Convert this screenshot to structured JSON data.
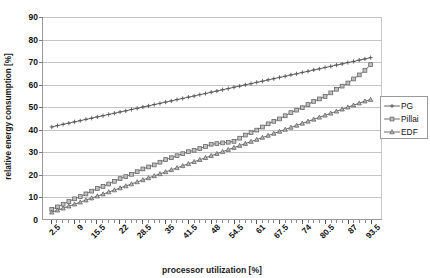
{
  "chart_data": {
    "type": "line",
    "title": "",
    "xlabel": "processor utilization [%]",
    "ylabel": "relative energy consumption [%]",
    "xlim": [
      0,
      96.75
    ],
    "ylim": [
      0,
      90
    ],
    "ytick_labels": [
      "0",
      "10",
      "20",
      "30",
      "40",
      "50",
      "60",
      "70",
      "80",
      "90"
    ],
    "ytick_values": [
      0,
      10,
      20,
      30,
      40,
      50,
      60,
      70,
      80,
      90
    ],
    "xtick_labels": [
      "2.5",
      "9",
      "15.5",
      "22",
      "28.5",
      "35",
      "41.5",
      "48",
      "54.5",
      "61",
      "67.5",
      "74",
      "80.5",
      "87",
      "93.5"
    ],
    "xtick_values": [
      2.5,
      9,
      15.5,
      22,
      28.5,
      35,
      41.5,
      48,
      54.5,
      61,
      67.5,
      74,
      80.5,
      87,
      93.5
    ],
    "grid": true,
    "legend_position": "right",
    "x": [
      2.5,
      4.125,
      5.75,
      7.375,
      9,
      10.625,
      12.25,
      13.875,
      15.5,
      17.125,
      18.75,
      20.375,
      22,
      23.625,
      25.25,
      26.875,
      28.5,
      30.125,
      31.75,
      33.375,
      35,
      36.625,
      38.25,
      39.875,
      41.5,
      43.125,
      44.75,
      46.375,
      48,
      49.625,
      51.25,
      52.875,
      54.5,
      56.125,
      57.75,
      59.375,
      61,
      62.625,
      64.25,
      65.875,
      67.5,
      69.125,
      70.75,
      72.375,
      74,
      75.625,
      77.25,
      78.875,
      80.5,
      82.125,
      83.75,
      85.375,
      87,
      88.625,
      90.25,
      91.875,
      93.5
    ],
    "series": [
      {
        "name": "PG",
        "marker": "plus",
        "color": "#555555",
        "values": [
          41.0,
          41.6,
          42.2,
          42.7,
          43.3,
          43.8,
          44.4,
          44.9,
          45.5,
          46.0,
          46.6,
          47.1,
          47.7,
          48.2,
          48.8,
          49.3,
          49.9,
          50.4,
          51.0,
          51.5,
          52.1,
          52.6,
          53.2,
          53.7,
          54.3,
          54.8,
          55.4,
          55.9,
          56.5,
          57.0,
          57.6,
          58.1,
          58.7,
          59.2,
          59.8,
          60.3,
          60.9,
          61.4,
          62.0,
          62.5,
          63.1,
          63.6,
          64.2,
          64.7,
          65.3,
          65.8,
          66.4,
          66.9,
          67.5,
          68.0,
          68.6,
          69.1,
          69.7,
          70.2,
          70.8,
          71.3,
          71.9
        ]
      },
      {
        "name": "Pillai",
        "marker": "square",
        "color": "#666666",
        "values": [
          4.3,
          5.4,
          6.6,
          7.8,
          9.0,
          10.0,
          11.2,
          12.4,
          13.6,
          14.5,
          15.6,
          16.8,
          18.0,
          18.9,
          19.9,
          21.1,
          22.3,
          23.2,
          24.1,
          25.3,
          26.5,
          27.3,
          28.2,
          29.1,
          30.0,
          30.6,
          31.4,
          32.3,
          33.3,
          33.6,
          33.9,
          34.2,
          34.6,
          36.0,
          37.4,
          38.5,
          39.6,
          41.0,
          42.4,
          43.5,
          44.6,
          46.0,
          47.4,
          48.5,
          49.6,
          51.0,
          52.4,
          53.5,
          54.6,
          56.2,
          57.8,
          59.2,
          60.6,
          62.4,
          64.2,
          66.2,
          68.8
        ]
      },
      {
        "name": "EDF",
        "marker": "triangle",
        "color": "#5a5a5a",
        "values": [
          3.0,
          3.9,
          4.8,
          5.7,
          6.6,
          7.5,
          8.4,
          9.3,
          10.2,
          11.1,
          12.0,
          12.9,
          13.8,
          14.7,
          15.6,
          16.5,
          17.4,
          18.3,
          19.2,
          20.1,
          21.0,
          21.9,
          22.8,
          23.7,
          24.6,
          25.5,
          26.4,
          27.3,
          28.2,
          29.1,
          30.0,
          30.9,
          31.8,
          32.7,
          33.6,
          34.5,
          35.4,
          36.3,
          37.2,
          38.1,
          39.0,
          39.9,
          40.8,
          41.7,
          42.6,
          43.5,
          44.4,
          45.3,
          46.2,
          47.1,
          48.0,
          48.9,
          49.8,
          50.7,
          51.6,
          52.5,
          53.2
        ]
      }
    ]
  },
  "legend": {
    "items": [
      {
        "label": "PG"
      },
      {
        "label": "Pillai"
      },
      {
        "label": "EDF"
      }
    ]
  }
}
